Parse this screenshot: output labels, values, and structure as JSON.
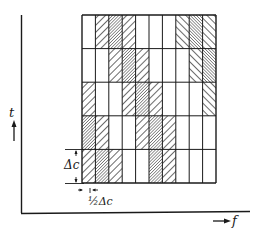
{
  "figure": {
    "y_axis_label": "t",
    "x_axis_label": "f",
    "delta_label": "Δc",
    "half_delta_label": "½Δc",
    "half_delta_prefix": "½",
    "delta_symbol": "Δc"
  },
  "grid": {
    "columns": 10,
    "rows": 5,
    "legend": {
      "E": "empty",
      "B": "backslash hatch",
      "D": "dense backslash hatch",
      "F": "forward-slash hatch",
      "G": "dense forward-slash hatch"
    },
    "cells": [
      [
        "E",
        "B",
        "D",
        "B",
        "E",
        "E",
        "E",
        "F",
        "G",
        "F"
      ],
      [
        "E",
        "E",
        "B",
        "D",
        "B",
        "E",
        "E",
        "E",
        "F",
        "G"
      ],
      [
        "B",
        "E",
        "E",
        "B",
        "D",
        "B",
        "E",
        "E",
        "E",
        "F"
      ],
      [
        "D",
        "B",
        "E",
        "E",
        "B",
        "D",
        "B",
        "E",
        "E",
        "E"
      ],
      [
        "B",
        "D",
        "B",
        "E",
        "E",
        "D",
        "B",
        "E",
        "E",
        "E"
      ]
    ]
  },
  "colors": {
    "ink": "#1a1a1a",
    "background": "#ffffff"
  }
}
